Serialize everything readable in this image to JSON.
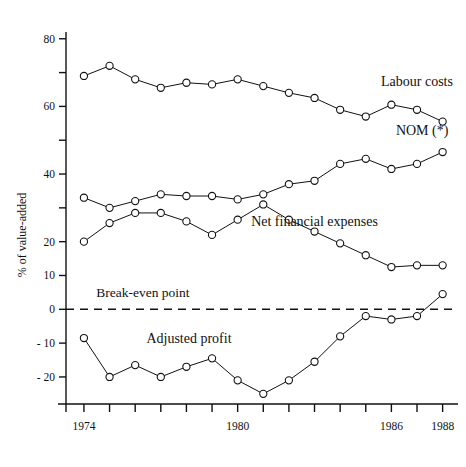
{
  "chart_data": {
    "type": "line",
    "title": "",
    "xlabel": "",
    "ylabel": "% of value-added",
    "xlim": [
      1973.3,
      1988.6
    ],
    "ylim": [
      -28,
      82
    ],
    "grid": false,
    "legend": "inline-annotations",
    "x": [
      1974,
      1975,
      1976,
      1977,
      1978,
      1979,
      1980,
      1981,
      1982,
      1983,
      1984,
      1985,
      1986,
      1987,
      1988
    ],
    "x_tick_values": [
      1974,
      1975,
      1976,
      1977,
      1978,
      1979,
      1980,
      1981,
      1982,
      1983,
      1984,
      1985,
      1986,
      1987,
      1988
    ],
    "x_tick_labels": [
      "1974",
      "",
      "",
      "",
      "",
      "",
      "1980",
      "",
      "",
      "",
      "",
      "",
      "1986",
      "",
      "1988"
    ],
    "y_tick_values": [
      80,
      70,
      60,
      50,
      40,
      30,
      20,
      10,
      0,
      -10,
      -20
    ],
    "y_tick_labels": [
      "80",
      "",
      "60",
      "",
      "40",
      "",
      "20",
      "10",
      "0",
      "- 10",
      "- 20"
    ],
    "series": [
      {
        "name": "Labour costs",
        "label_x": 1987.0,
        "label_y": 66.0,
        "values": [
          69,
          72,
          68,
          65.5,
          67,
          66.5,
          68,
          66,
          64,
          62.5,
          59,
          57,
          60.5,
          59,
          55.5
        ]
      },
      {
        "name": "NOM (*)",
        "label_x": 1987.2,
        "label_y": 51.5,
        "values": [
          33,
          30,
          32,
          34,
          33.5,
          33.5,
          32.5,
          34,
          37,
          38,
          43,
          44.5,
          41.5,
          43,
          46.5
        ]
      },
      {
        "name": "Net financial expenses",
        "label_x": 1983.0,
        "label_y": 24.5,
        "values": [
          20,
          25.5,
          28.5,
          28.5,
          26,
          22,
          26.5,
          31,
          26.5,
          23,
          19.5,
          16,
          12.5,
          13,
          13
        ]
      },
      {
        "name": "Adjusted profit",
        "label_x": 1978.1,
        "label_y": -10.0,
        "values": [
          -8.5,
          -20,
          -16.5,
          -20,
          -17,
          -14.5,
          -21,
          -25,
          -21,
          -15.5,
          -8,
          -2,
          -3,
          -2,
          4.5
        ]
      }
    ],
    "annotations": [
      {
        "name": "break-even-point",
        "text": "Break-even point",
        "x": 1976.3,
        "y": 3.5
      }
    ],
    "reference_line": {
      "name": "break-even-line",
      "y": 0,
      "style": "dashed"
    }
  }
}
